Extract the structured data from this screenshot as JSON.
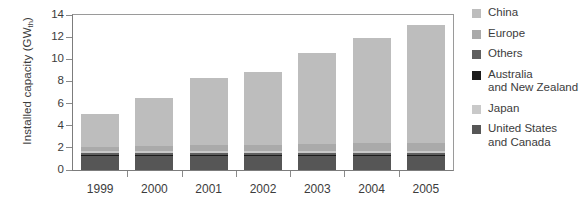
{
  "chart_data": {
    "type": "bar",
    "subtype": "stacked-vertical",
    "title": "",
    "xlabel": "",
    "ylabel": "Installed capacity (GWth)",
    "ylabel_base": "Installed capacity (GW",
    "ylabel_sub": "th",
    "ylabel_suffix": ")",
    "categories": [
      "1999",
      "2000",
      "2001",
      "2002",
      "2003",
      "2004",
      "2005"
    ],
    "ylim": [
      0,
      14
    ],
    "yticks": [
      0,
      2,
      4,
      6,
      8,
      10,
      12,
      14
    ],
    "ytick_labels": [
      "0",
      "2",
      "4",
      "6",
      "8",
      "10",
      "12",
      "14"
    ],
    "grid": false,
    "legend_position": "right",
    "stack_order_bottom_to_top": [
      "United States and Canada",
      "Australia and New Zealand",
      "Others",
      "Japan",
      "Europe",
      "China"
    ],
    "series": [
      {
        "name": "United States and Canada",
        "color": "#565656",
        "values": [
          1.3,
          1.3,
          1.3,
          1.25,
          1.3,
          1.3,
          1.3
        ]
      },
      {
        "name": "Australia and New Zealand",
        "color": "#1c1c1c",
        "values": [
          0.1,
          0.1,
          0.1,
          0.1,
          0.1,
          0.1,
          0.1
        ]
      },
      {
        "name": "Others",
        "color": "#5f5f5f",
        "values": [
          0.15,
          0.15,
          0.15,
          0.15,
          0.15,
          0.15,
          0.15
        ]
      },
      {
        "name": "Japan",
        "color": "#c9c9c9",
        "values": [
          0.2,
          0.2,
          0.2,
          0.2,
          0.2,
          0.2,
          0.2
        ]
      },
      {
        "name": "Europe",
        "color": "#aaaaaa",
        "values": [
          0.35,
          0.45,
          0.5,
          0.55,
          0.6,
          0.65,
          0.7
        ]
      },
      {
        "name": "China",
        "color": "#bdbdbd",
        "values": [
          3.0,
          4.3,
          6.05,
          6.65,
          8.25,
          9.5,
          10.65
        ]
      }
    ],
    "totals": [
      5.1,
      6.5,
      8.3,
      8.9,
      10.6,
      11.9,
      13.1
    ],
    "colors": {
      "axis": "#7c7c7c",
      "text": "#3c3c3c",
      "background": "#ffffff"
    }
  },
  "legend": {
    "items": [
      {
        "label": "China",
        "color": "#bdbdbd"
      },
      {
        "label": "Europe",
        "color": "#aaaaaa"
      },
      {
        "label": "Others",
        "color": "#5f5f5f"
      },
      {
        "label": "Australia\nand New Zealand",
        "color": "#1c1c1c"
      },
      {
        "label": "Japan",
        "color": "#c9c9c9"
      },
      {
        "label": "United States\nand Canada",
        "color": "#565656"
      }
    ]
  }
}
